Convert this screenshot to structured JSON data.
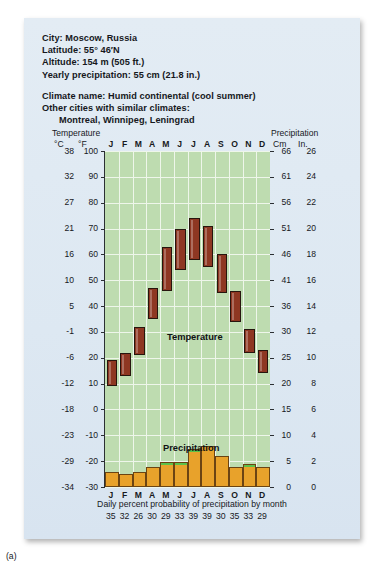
{
  "info": {
    "city": "City: Moscow, Russia",
    "latitude": "Latitude: 55° 46′N",
    "altitude": "Altitude: 154 m (505 ft.)",
    "yearly_precipitation": "Yearly precipitation: 55 cm (21.8 in.)",
    "climate_name": "Climate name: Humid continental (cool summer)",
    "similar_intro": "Other cities with similar climates:",
    "similar_cities": "Montreal, Winnipeg, Leningrad"
  },
  "axes": {
    "temperature_caption": "Temperature",
    "precipitation_caption": "Precipitation",
    "unit_c": "°C",
    "unit_f": "°F",
    "unit_cm": "Cm",
    "unit_in": "In."
  },
  "labels": {
    "temperature": "Temperature",
    "precipitation": "Precipitation",
    "probability_caption": "Daily percent probability of precipitation by month",
    "figure": "(a)"
  },
  "colors": {
    "card_background": "#dde8f2",
    "plot_background": "#bedcb0",
    "gridline": "#eef6ea",
    "temperature_bar": "#8e3722",
    "precipitation_bar": "#e8a22b",
    "precipitation_tip": "#5cc24a",
    "axis": "#2b2f33",
    "text": "#17191d"
  },
  "chart_data": {
    "type": "bar",
    "categories": [
      "J",
      "F",
      "M",
      "A",
      "M",
      "J",
      "J",
      "A",
      "S",
      "O",
      "N",
      "D"
    ],
    "month_labels_top": [
      "J",
      "F",
      "M",
      "A",
      "M",
      "J",
      "J",
      "A",
      "S",
      "O",
      "N",
      "D"
    ],
    "month_labels_bottom": [
      "J",
      "F",
      "M",
      "A",
      "M",
      "J",
      "J",
      "A",
      "S",
      "O",
      "N",
      "D"
    ],
    "left_axis": {
      "label": "Temperature",
      "unit_primary": "°C",
      "unit_secondary": "°F",
      "ticks_c": [
        38,
        32,
        27,
        21,
        16,
        10,
        5,
        -1,
        -6,
        -12,
        -18,
        -23,
        -29,
        -34
      ],
      "ticks_f": [
        100,
        90,
        80,
        70,
        60,
        50,
        40,
        30,
        20,
        10,
        0,
        -10,
        -20,
        -30
      ],
      "ylim_f": [
        -30,
        100
      ]
    },
    "right_axis": {
      "label": "Precipitation",
      "unit_primary": "Cm",
      "unit_secondary": "In.",
      "ticks_cm": [
        66,
        61,
        56,
        51,
        46,
        41,
        36,
        30,
        25,
        20,
        15,
        10,
        5,
        0
      ],
      "ticks_in": [
        26,
        24,
        22,
        20,
        18,
        16,
        14,
        12,
        10,
        8,
        6,
        4,
        2,
        0
      ],
      "ylim_cm": [
        0,
        66
      ]
    },
    "series": [
      {
        "name": "Temperature range",
        "type": "range-bar",
        "unit": "°F",
        "color": "#8e3722",
        "low_f": [
          9,
          13,
          21,
          35,
          46,
          54,
          58,
          55,
          45,
          34,
          22,
          14
        ],
        "high_f": [
          19,
          22,
          32,
          47,
          63,
          70,
          74,
          71,
          60,
          46,
          31,
          23
        ]
      },
      {
        "name": "Precipitation",
        "type": "bar",
        "unit": "cm",
        "color": "#e8a22b",
        "values": [
          3.0,
          2.5,
          3.0,
          4.0,
          5.0,
          5.0,
          7.5,
          8.0,
          6.0,
          4.0,
          4.5,
          4.0
        ],
        "tip_months": [
          "M",
          "J",
          "N"
        ]
      }
    ],
    "daily_percent_probability": {
      "caption": "Daily percent probability of precipitation by month",
      "values": [
        35,
        32,
        26,
        30,
        29,
        33,
        39,
        39,
        30,
        35,
        33,
        29
      ]
    },
    "annotations": [
      "Temperature",
      "Precipitation"
    ],
    "grid": true,
    "legend": "none"
  }
}
